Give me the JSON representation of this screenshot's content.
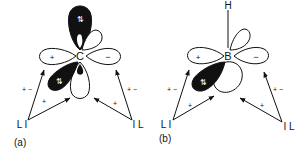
{
  "panels": [
    {
      "id": "a",
      "caption": "(a)",
      "center_atom": "C",
      "left_lobe_sign": "+",
      "right_lobe_sign": "−",
      "ligand_left": "L I",
      "ligand_right": "I L",
      "left_arrow_sign_upper": "+ −",
      "left_arrow_sign_lower": "+",
      "right_arrow_sign_upper": "+ −",
      "right_arrow_sign_lower": "+",
      "electrons_top": "⇅",
      "electrons_lower": "⇅"
    },
    {
      "id": "b",
      "caption": "(b)",
      "center_atom": "B",
      "substituent": "H",
      "left_lobe_sign": "+",
      "right_lobe_sign": "−",
      "ligand_left": "L I",
      "ligand_right": "I L",
      "left_arrow_sign_upper": "+ −",
      "left_arrow_sign_lower": "+",
      "right_arrow_sign_upper": "+ −",
      "right_arrow_sign_lower": "+",
      "electrons_lower": "⇅"
    }
  ],
  "colors": {
    "ink": "#111111",
    "background": "#ffffff"
  }
}
